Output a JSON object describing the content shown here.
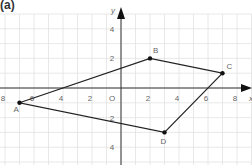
{
  "figure": {
    "panel_label": "(a)",
    "x_axis_label": "x",
    "y_axis_label": "y",
    "origin_label": "O",
    "x_ticks": [
      {
        "value": -8,
        "label": "8"
      },
      {
        "value": -6,
        "label": "6"
      },
      {
        "value": -4,
        "label": "4"
      },
      {
        "value": -2,
        "label": "2"
      },
      {
        "value": 2,
        "label": "2"
      },
      {
        "value": 4,
        "label": "4"
      },
      {
        "value": 6,
        "label": "6"
      },
      {
        "value": 8,
        "label": "8"
      }
    ],
    "y_ticks": [
      {
        "value": 4,
        "label": "4"
      },
      {
        "value": 2,
        "label": "2"
      },
      {
        "value": -2,
        "label": "2"
      },
      {
        "value": -4,
        "label": "4"
      }
    ],
    "points": [
      {
        "name": "A",
        "x": -7,
        "y": -1
      },
      {
        "name": "B",
        "x": 2,
        "y": 2
      },
      {
        "name": "C",
        "x": 7,
        "y": 1
      },
      {
        "name": "D",
        "x": 3,
        "y": -3
      }
    ],
    "polygon_order": [
      "A",
      "B",
      "C",
      "D"
    ],
    "colors": {
      "grid": "#e2e2e2",
      "axis": "#333333",
      "shape": "#222222",
      "text": "#666666"
    }
  }
}
